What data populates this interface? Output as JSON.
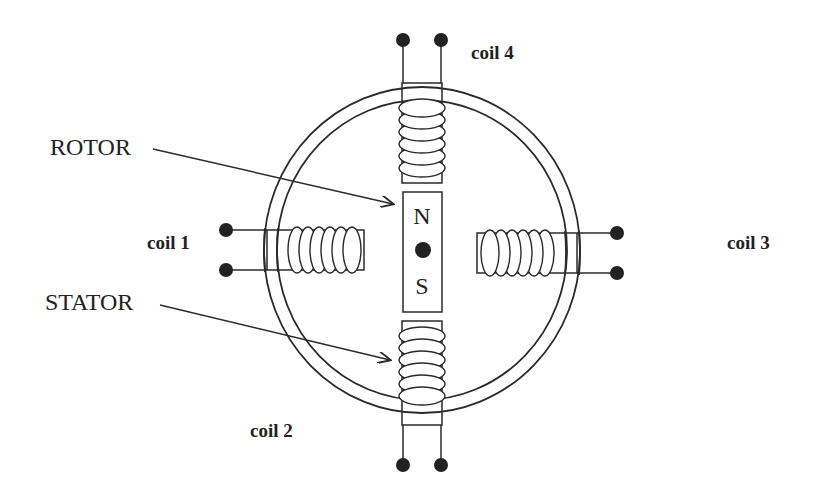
{
  "diagram": {
    "type": "stepper-motor-schematic",
    "labels": {
      "rotor": "ROTOR",
      "stator": "STATOR",
      "north": "N",
      "south": "S"
    },
    "coils": [
      {
        "id": "coil1",
        "label": "coil 1",
        "side": "left",
        "turns": 6
      },
      {
        "id": "coil2",
        "label": "coil 2",
        "side": "bottom",
        "turns": 6
      },
      {
        "id": "coil3",
        "label": "coil 3",
        "side": "right",
        "turns": 6
      },
      {
        "id": "coil4",
        "label": "coil 4",
        "side": "top",
        "turns": 6
      }
    ],
    "colors": {
      "stroke": "#2a2a2a",
      "terminal": "#222222",
      "background": "#ffffff"
    }
  }
}
